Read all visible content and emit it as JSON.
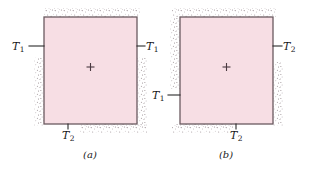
{
  "figure": {
    "background_color": "#ffffff",
    "panel_fill_color": "#f7dee4",
    "panel_border_color": "#6b5a60",
    "stipple_color": "#9b8f93",
    "leader_line_color": "#2a2a2a",
    "center_marker": "plus-marker",
    "panels": [
      {
        "id": "panel-a",
        "caption": "(a)",
        "box": {
          "x": 44,
          "y": 17,
          "width": 93,
          "height": 107
        },
        "center_marker_symbol": "+",
        "labels": [
          {
            "id": "label-a-left",
            "symbol": "T",
            "subscript": "1",
            "full_text": "T1",
            "side": "left",
            "text_x": 12,
            "text_y": 41,
            "leader": {
              "x1": 29,
              "y1": 46,
              "x2": 44,
              "y2": 46
            }
          },
          {
            "id": "label-a-right",
            "symbol": "T",
            "subscript": "1",
            "full_text": "T1",
            "side": "right",
            "text_x": 146,
            "text_y": 41,
            "leader": {
              "x1": 137,
              "y1": 46,
              "x2": 145,
              "y2": 46
            }
          },
          {
            "id": "label-a-bottom",
            "symbol": "T",
            "subscript": "2",
            "full_text": "T2",
            "side": "bottom",
            "text_x": 62,
            "text_y": 130,
            "leader": {
              "x1": 68,
              "y1": 124,
              "x2": 68,
              "y2": 129
            }
          }
        ],
        "insulation_edges": [
          "top",
          "left-lower",
          "right-lower",
          "bottom-right"
        ],
        "caption_x": 90,
        "caption_y": 150
      },
      {
        "id": "panel-b",
        "caption": "(b)",
        "box": {
          "x": 180,
          "y": 17,
          "width": 93,
          "height": 107
        },
        "center_marker_symbol": "+",
        "labels": [
          {
            "id": "label-b-left",
            "symbol": "T",
            "subscript": "1",
            "full_text": "T1",
            "side": "left",
            "text_x": 152,
            "text_y": 90,
            "leader": {
              "x1": 168,
              "y1": 95,
              "x2": 180,
              "y2": 95
            }
          },
          {
            "id": "label-b-right",
            "symbol": "T",
            "subscript": "2",
            "full_text": "T2",
            "side": "right",
            "text_x": 283,
            "text_y": 41,
            "leader": {
              "x1": 273,
              "y1": 46,
              "x2": 282,
              "y2": 46
            }
          },
          {
            "id": "label-b-bottom",
            "symbol": "T",
            "subscript": "2",
            "full_text": "T2",
            "side": "bottom",
            "text_x": 230,
            "text_y": 130,
            "leader": {
              "x1": 236,
              "y1": 124,
              "x2": 236,
              "y2": 129
            }
          }
        ],
        "insulation_edges": [
          "top",
          "left-upper",
          "right-lower",
          "bottom-left"
        ],
        "caption_x": 226,
        "caption_y": 150
      }
    ]
  }
}
